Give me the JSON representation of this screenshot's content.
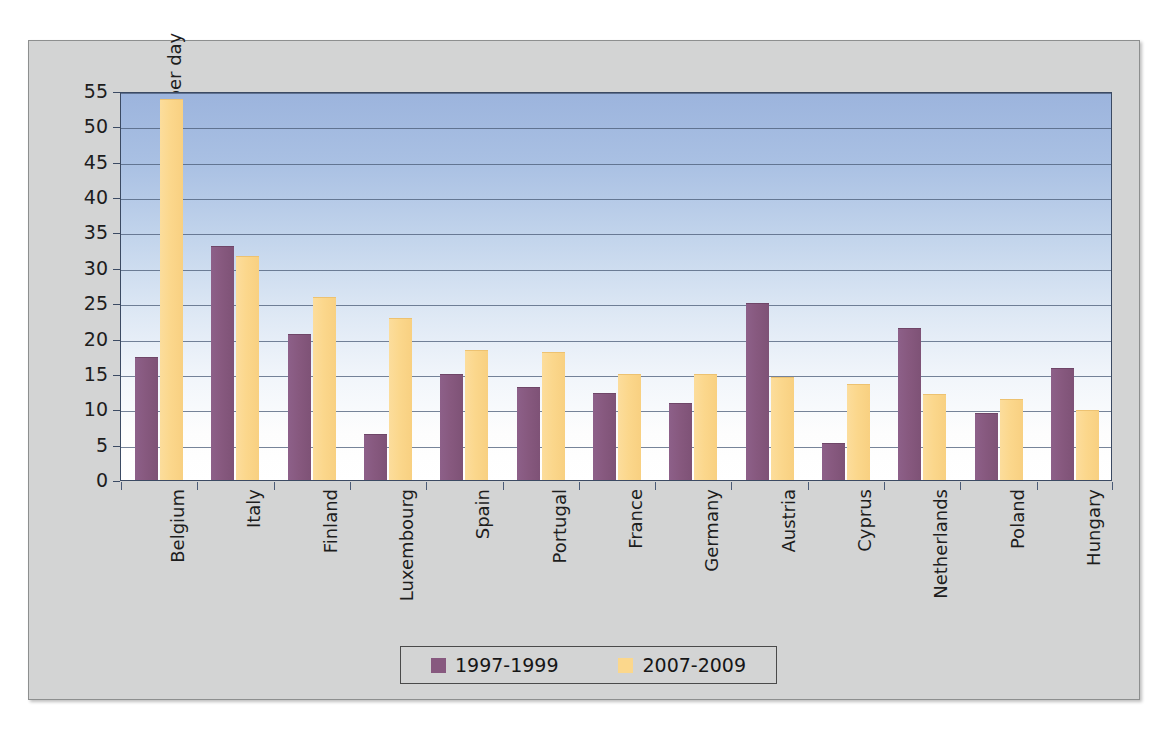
{
  "chart_data": {
    "type": "bar",
    "title": "",
    "xlabel": "",
    "ylabel": "S-DDD per 1,000 inhabitants per day",
    "ylim": [
      0,
      55
    ],
    "yticks": [
      0,
      5,
      10,
      15,
      20,
      25,
      30,
      35,
      40,
      45,
      50,
      55
    ],
    "grid": true,
    "legend_position": "bottom",
    "categories": [
      "Belgium",
      "Italy",
      "Finland",
      "Luxembourg",
      "Spain",
      "Portugal",
      "France",
      "Germany",
      "Austria",
      "Cyprus",
      "Netherlands",
      "Poland",
      "Hungary"
    ],
    "series": [
      {
        "name": "1997-1999",
        "color": "#87597f",
        "values": [
          17.2,
          32.9,
          20.5,
          6.3,
          14.8,
          13.0,
          12.2,
          10.8,
          24.9,
          5.1,
          21.3,
          9.3,
          15.7
        ]
      },
      {
        "name": "2007-2009",
        "color": "#fbd78c",
        "values": [
          53.7,
          31.6,
          25.7,
          22.8,
          18.3,
          18.0,
          14.8,
          14.8,
          14.4,
          13.5,
          12.0,
          11.3,
          9.7
        ]
      }
    ]
  },
  "legend": {
    "entries": [
      {
        "label": "1997-1999"
      },
      {
        "label": "2007-2009"
      }
    ]
  }
}
